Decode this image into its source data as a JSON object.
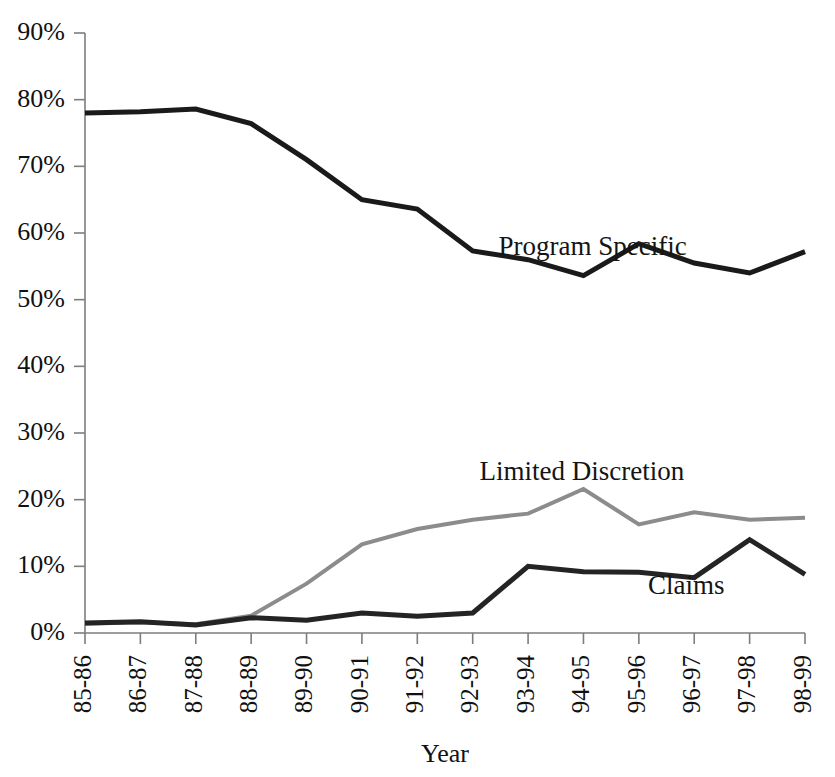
{
  "chart_data": {
    "type": "line",
    "title": "",
    "xlabel": "Year",
    "ylabel": "",
    "ylim": [
      0,
      90
    ],
    "ytick_step": 10,
    "grid": false,
    "legend": "inline-labels",
    "categories": [
      "85-86",
      "86-87",
      "87-88",
      "88-89",
      "89-90",
      "90-91",
      "91-92",
      "92-93",
      "93-94",
      "94-95",
      "95-96",
      "96-97",
      "97-98",
      "98-99"
    ],
    "ytick_labels": [
      "0%",
      "10%",
      "20%",
      "30%",
      "40%",
      "50%",
      "60%",
      "70%",
      "80%",
      "90%"
    ],
    "ytick_values": [
      0,
      10,
      20,
      30,
      40,
      50,
      60,
      70,
      80,
      90
    ],
    "series": [
      {
        "name": "Program Specific",
        "color": "#1a1a1a",
        "stroke_width": 5,
        "values": [
          78.0,
          78.2,
          78.6,
          76.4,
          71.0,
          65.0,
          63.6,
          57.3,
          56.0,
          53.6,
          58.4,
          55.5,
          54.0,
          57.2
        ],
        "label_x_pct": 70.5,
        "label_y_pct": 63.0
      },
      {
        "name": "Limited Discretion",
        "color": "#8c8c8c",
        "stroke_width": 4,
        "values": [
          1.4,
          1.6,
          1.3,
          2.6,
          7.4,
          13.3,
          15.6,
          17.0,
          17.9,
          21.6,
          16.3,
          18.1,
          17.0,
          17.3
        ],
        "label_x_pct": 69.0,
        "label_y_pct": 25.5
      },
      {
        "name": "Claims",
        "color": "#242424",
        "stroke_width": 5,
        "values": [
          1.5,
          1.7,
          1.2,
          2.3,
          1.9,
          3.0,
          2.5,
          3.0,
          10.0,
          9.2,
          9.1,
          8.3,
          14.0,
          8.8
        ],
        "label_x_pct": 83.5,
        "label_y_pct": 6.5
      }
    ]
  },
  "axes": {
    "x_axis_title": "Year",
    "x_tick_rotation": -90
  }
}
